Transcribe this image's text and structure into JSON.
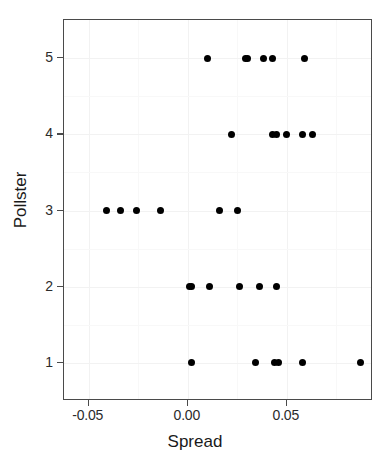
{
  "chart_data": {
    "type": "scatter",
    "title": "",
    "xlabel": "Spread",
    "ylabel": "Pollster",
    "xlim": [
      -0.0625,
      0.0935
    ],
    "ylim": [
      0.5,
      5.5
    ],
    "grid": true,
    "legend": false,
    "x_ticks": [
      -0.05,
      0.0,
      0.05
    ],
    "x_tick_labels": [
      "-0.05",
      "0.00",
      "0.05"
    ],
    "y_ticks": [
      1,
      2,
      3,
      4,
      5
    ],
    "y_tick_labels": [
      "1",
      "2",
      "3",
      "4",
      "5"
    ],
    "point_color": "#000000",
    "panel_border_color": "#4a4a4a",
    "grid_color": "#f2f2f2",
    "background": "#ffffff",
    "points": [
      {
        "x": 0.01,
        "y": 5
      },
      {
        "x": 0.029,
        "y": 5
      },
      {
        "x": 0.03,
        "y": 5
      },
      {
        "x": 0.038,
        "y": 5
      },
      {
        "x": 0.043,
        "y": 5
      },
      {
        "x": 0.059,
        "y": 5
      },
      {
        "x": 0.022,
        "y": 4
      },
      {
        "x": 0.043,
        "y": 4
      },
      {
        "x": 0.045,
        "y": 4
      },
      {
        "x": 0.05,
        "y": 4
      },
      {
        "x": 0.058,
        "y": 4
      },
      {
        "x": 0.063,
        "y": 4
      },
      {
        "x": -0.041,
        "y": 3
      },
      {
        "x": -0.034,
        "y": 3
      },
      {
        "x": -0.026,
        "y": 3
      },
      {
        "x": -0.014,
        "y": 3
      },
      {
        "x": 0.016,
        "y": 3
      },
      {
        "x": 0.025,
        "y": 3
      },
      {
        "x": 0.001,
        "y": 2
      },
      {
        "x": 0.002,
        "y": 2
      },
      {
        "x": 0.011,
        "y": 2
      },
      {
        "x": 0.026,
        "y": 2
      },
      {
        "x": 0.036,
        "y": 2
      },
      {
        "x": 0.045,
        "y": 2
      },
      {
        "x": 0.002,
        "y": 1
      },
      {
        "x": 0.034,
        "y": 1
      },
      {
        "x": 0.044,
        "y": 1
      },
      {
        "x": 0.046,
        "y": 1
      },
      {
        "x": 0.058,
        "y": 1
      },
      {
        "x": 0.087,
        "y": 1
      }
    ]
  },
  "axes": {
    "x_title": "Spread",
    "y_title": "Pollster"
  }
}
